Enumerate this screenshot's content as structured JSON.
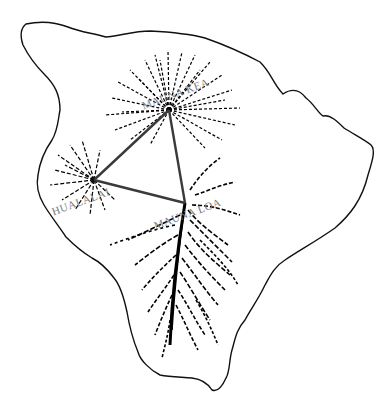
{
  "map": {
    "subject": "Island of Hawaii",
    "labels": {
      "mauna_kea": "MAUNA KEA",
      "hualalai": "HUALALAI",
      "mauna_loa": "MAUNA LOA"
    },
    "triangle": {
      "vertices": [
        {
          "name": "Mauna Kea",
          "x": 169,
          "y": 110
        },
        {
          "name": "Hualalai",
          "x": 94,
          "y": 180
        },
        {
          "name": "Mauna Loa",
          "x": 185,
          "y": 203
        }
      ],
      "stroke": "#3a3a3a"
    },
    "colors": {
      "background": "#ffffff",
      "outline": "#111111",
      "drainage": "#000000",
      "label": "#7a7a7a"
    }
  }
}
